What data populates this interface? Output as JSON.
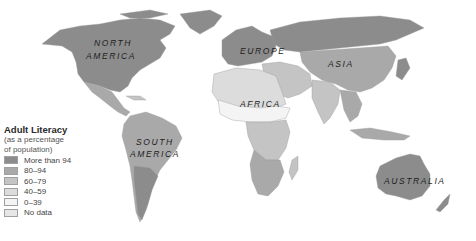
{
  "legend": {
    "title": "Adult Literacy",
    "subtitle_line1": "(as a percentage",
    "subtitle_line2": "of population)",
    "items": [
      {
        "label": "More than 94",
        "color": "#8c8c8c"
      },
      {
        "label": "80–94",
        "color": "#a9a9a9"
      },
      {
        "label": "60–79",
        "color": "#c4c4c4"
      },
      {
        "label": "40–59",
        "color": "#dcdcdc"
      },
      {
        "label": "0–39",
        "color": "#f4f4f4"
      },
      {
        "label": "No data",
        "color": "#e6e6e6"
      }
    ]
  },
  "labels": {
    "north_america_1": "NORTH",
    "north_america_2": "AMERICA",
    "south_america_1": "SOUTH",
    "south_america_2": "AMERICA",
    "europe": "EUROPE",
    "asia": "ASIA",
    "africa": "AFRICA",
    "australia": "AUSTRALIA"
  },
  "colors": {
    "c94": "#8c8c8c",
    "c80": "#a9a9a9",
    "c60": "#c4c4c4",
    "c40": "#dcdcdc",
    "c0": "#f4f4f4",
    "nodata": "#e6e6e6"
  }
}
